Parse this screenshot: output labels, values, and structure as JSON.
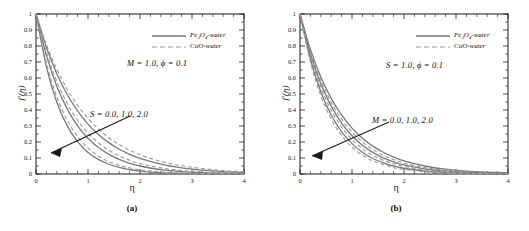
{
  "figure": {
    "panels": [
      {
        "caption": "(a)",
        "xlabel": "η",
        "ylabel": "f′(η)",
        "xticks": [
          "0",
          "1",
          "2",
          "3",
          "4"
        ],
        "yticks": [
          "0",
          "0.1",
          "0.2",
          "0.3",
          "0.4",
          "0.5",
          "0.6",
          "0.7",
          "0.8",
          "0.9",
          "1"
        ],
        "legend": [
          {
            "label_main": "Fe",
            "sub1": "3",
            "label_mid": "O",
            "sub2": "4",
            "label_tail": "-water",
            "style": "solid"
          },
          {
            "label_main": "CuO",
            "sub1": "",
            "label_mid": "",
            "sub2": "",
            "label_tail": "-water",
            "style": "dashed"
          }
        ],
        "parameter_note": "M = 1.0, ϕ = 0.1",
        "arrow_label": "S = 0.0, 1.0, 2.0"
      },
      {
        "caption": "(b)",
        "xlabel": "η",
        "ylabel": "f′(η)",
        "xticks": [
          "0",
          "1",
          "2",
          "3",
          "4"
        ],
        "yticks": [
          "0",
          "0.1",
          "0.2",
          "0.3",
          "0.4",
          "0.5",
          "0.6",
          "0.7",
          "0.8",
          "0.9",
          "1"
        ],
        "legend": [
          {
            "label_main": "Fe",
            "sub1": "3",
            "label_mid": "O",
            "sub2": "4",
            "label_tail": "-water",
            "style": "solid"
          },
          {
            "label_main": "CuO",
            "sub1": "",
            "label_mid": "",
            "sub2": "",
            "label_tail": "-water",
            "style": "dashed"
          }
        ],
        "parameter_note": "S = 1.0, ϕ = 0.1",
        "arrow_label": "M = 0.0, 1.0, 2.0"
      }
    ]
  },
  "style": {
    "curve_color": "#7a7a7a",
    "axis_color": "#1a1a1a",
    "background": "#ffffff"
  },
  "chart_data": [
    {
      "type": "line",
      "title": "(a)",
      "xlabel": "η",
      "ylabel": "f'(η)",
      "xlim": [
        0,
        4
      ],
      "ylim": [
        0,
        1
      ],
      "xticks": [
        0,
        1,
        2,
        3,
        4
      ],
      "yticks": [
        0,
        0.1,
        0.2,
        0.3,
        0.4,
        0.5,
        0.6,
        0.7,
        0.8,
        0.9,
        1.0
      ],
      "grid": false,
      "legend_position": "upper-right",
      "annotations": [
        "M = 1.0, ϕ = 0.1",
        "S = 0.0, 1.0, 2.0"
      ],
      "fixed_parameters": {
        "M": 1.0,
        "phi": 0.1
      },
      "varied_parameter": {
        "name": "S",
        "values": [
          0.0,
          1.0,
          2.0
        ]
      },
      "x": [
        0,
        0.2,
        0.4,
        0.6,
        0.8,
        1.0,
        1.2,
        1.4,
        1.6,
        1.8,
        2.0,
        2.4,
        2.8,
        3.2,
        3.6,
        4.0
      ],
      "series": [
        {
          "name": "Fe3O4-water, S=0.0",
          "style": "solid",
          "values": [
            1.0,
            0.792,
            0.627,
            0.497,
            0.394,
            0.312,
            0.247,
            0.196,
            0.155,
            0.123,
            0.097,
            0.061,
            0.038,
            0.024,
            0.015,
            0.009
          ]
        },
        {
          "name": "CuO-water, S=0.0",
          "style": "dashed",
          "values": [
            1.0,
            0.809,
            0.655,
            0.53,
            0.429,
            0.347,
            0.281,
            0.227,
            0.184,
            0.149,
            0.12,
            0.079,
            0.052,
            0.034,
            0.022,
            0.014
          ]
        },
        {
          "name": "Fe3O4-water, S=1.0",
          "style": "solid",
          "values": [
            1.0,
            0.741,
            0.549,
            0.407,
            0.301,
            0.223,
            0.165,
            0.123,
            0.091,
            0.067,
            0.05,
            0.027,
            0.015,
            0.008,
            0.004,
            0.002
          ]
        },
        {
          "name": "CuO-water, S=1.0",
          "style": "dashed",
          "values": [
            1.0,
            0.761,
            0.579,
            0.441,
            0.336,
            0.256,
            0.195,
            0.148,
            0.113,
            0.086,
            0.065,
            0.038,
            0.022,
            0.013,
            0.007,
            0.004
          ]
        },
        {
          "name": "Fe3O4-water, S=2.0",
          "style": "solid",
          "values": [
            1.0,
            0.67,
            0.449,
            0.301,
            0.202,
            0.135,
            0.091,
            0.061,
            0.041,
            0.027,
            0.018,
            0.008,
            0.004,
            0.002,
            0.001,
            0.0
          ]
        },
        {
          "name": "CuO-water, S=2.0",
          "style": "dashed",
          "values": [
            1.0,
            0.695,
            0.483,
            0.336,
            0.233,
            0.162,
            0.113,
            0.078,
            0.054,
            0.038,
            0.026,
            0.013,
            0.006,
            0.003,
            0.001,
            0.001
          ]
        }
      ]
    },
    {
      "type": "line",
      "title": "(b)",
      "xlabel": "η",
      "ylabel": "f'(η)",
      "xlim": [
        0,
        4
      ],
      "ylim": [
        0,
        1
      ],
      "xticks": [
        0,
        1,
        2,
        3,
        4
      ],
      "yticks": [
        0,
        0.1,
        0.2,
        0.3,
        0.4,
        0.5,
        0.6,
        0.7,
        0.8,
        0.9,
        1.0
      ],
      "grid": false,
      "legend_position": "upper-right",
      "annotations": [
        "S = 1.0, ϕ = 0.1",
        "M = 0.0, 1.0, 2.0"
      ],
      "fixed_parameters": {
        "S": 1.0,
        "phi": 0.1
      },
      "varied_parameter": {
        "name": "M",
        "values": [
          0.0,
          1.0,
          2.0
        ]
      },
      "x": [
        0,
        0.2,
        0.4,
        0.6,
        0.8,
        1.0,
        1.2,
        1.4,
        1.6,
        1.8,
        2.0,
        2.4,
        2.8,
        3.2,
        3.6,
        4.0
      ],
      "series": [
        {
          "name": "Fe3O4-water, M=0.0",
          "style": "solid",
          "values": [
            1.0,
            0.779,
            0.607,
            0.473,
            0.369,
            0.287,
            0.224,
            0.174,
            0.136,
            0.106,
            0.082,
            0.05,
            0.03,
            0.018,
            0.011,
            0.007
          ]
        },
        {
          "name": "CuO-water, M=0.0",
          "style": "dashed",
          "values": [
            1.0,
            0.765,
            0.585,
            0.448,
            0.343,
            0.262,
            0.2,
            0.153,
            0.117,
            0.09,
            0.069,
            0.04,
            0.023,
            0.014,
            0.008,
            0.005
          ]
        },
        {
          "name": "Fe3O4-water, M=1.0",
          "style": "solid",
          "values": [
            1.0,
            0.751,
            0.564,
            0.424,
            0.318,
            0.239,
            0.18,
            0.135,
            0.101,
            0.076,
            0.057,
            0.032,
            0.018,
            0.01,
            0.006,
            0.003
          ]
        },
        {
          "name": "CuO-water, M=1.0",
          "style": "dashed",
          "values": [
            1.0,
            0.736,
            0.542,
            0.399,
            0.294,
            0.216,
            0.159,
            0.117,
            0.086,
            0.064,
            0.047,
            0.025,
            0.014,
            0.007,
            0.004,
            0.002
          ]
        },
        {
          "name": "Fe3O4-water, M=2.0",
          "style": "solid",
          "values": [
            1.0,
            0.717,
            0.514,
            0.369,
            0.264,
            0.19,
            0.136,
            0.097,
            0.07,
            0.05,
            0.036,
            0.018,
            0.009,
            0.005,
            0.002,
            0.001
          ]
        },
        {
          "name": "CuO-water, M=2.0",
          "style": "dashed",
          "values": [
            1.0,
            0.7,
            0.49,
            0.343,
            0.24,
            0.168,
            0.118,
            0.082,
            0.058,
            0.04,
            0.028,
            0.014,
            0.007,
            0.003,
            0.002,
            0.001
          ]
        }
      ]
    }
  ]
}
